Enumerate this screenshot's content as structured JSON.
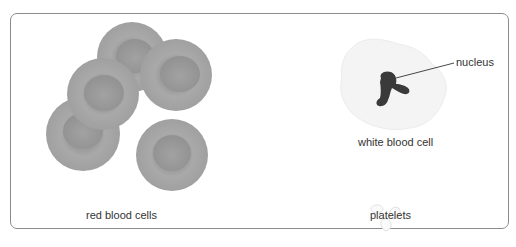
{
  "diagram": {
    "title": "",
    "labels": {
      "red_blood_cells": "red blood cells",
      "white_blood_cell": "white blood cell",
      "nucleus": "nucleus",
      "platelets": "platelets"
    },
    "colors": {
      "frame": "#8c8c8c",
      "red_cell": "#a3a3a3",
      "red_cell_center": "#959595",
      "white_cell": "#f4f4f4",
      "nucleus": "#3a3a3a",
      "text": "#333333"
    }
  }
}
